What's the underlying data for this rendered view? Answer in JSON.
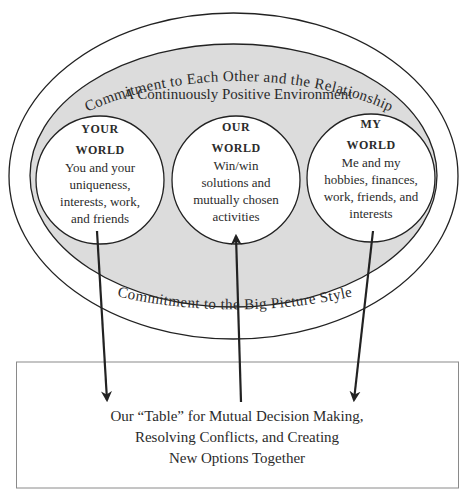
{
  "diagram": {
    "outer_ring_top_label": "Commitment to Each Other and the Relationship",
    "outer_ring_bottom_label": "Commitment to the Big Picture Style",
    "environment_label": "A Continuously Positive Environment",
    "worlds": [
      {
        "id": "your-world",
        "title_line1": "YOUR",
        "title_line2": "WORLD",
        "body": [
          "You and your",
          "uniqueness,",
          "interests, work,",
          "and friends"
        ],
        "arrow_direction": "to-table"
      },
      {
        "id": "our-world",
        "title_line1": "OUR",
        "title_line2": "WORLD",
        "body": [
          "Win/win",
          "solutions and",
          "mutually chosen",
          "activities"
        ],
        "arrow_direction": "from-table"
      },
      {
        "id": "my-world",
        "title_line1": "MY",
        "title_line2": "WORLD",
        "body": [
          "Me and my",
          "hobbies, finances,",
          "work, friends, and",
          "interests"
        ],
        "arrow_direction": "to-table"
      }
    ],
    "table_box": {
      "lines": [
        "Our “Table” for Mutual Decision Making,",
        "Resolving Conflicts, and Creating",
        "New Options Together"
      ]
    },
    "colors": {
      "environment_fill": "#dcdcdc",
      "line": "#222222",
      "text": "#2b2b2b",
      "box_border": "#8a8a8a"
    }
  }
}
